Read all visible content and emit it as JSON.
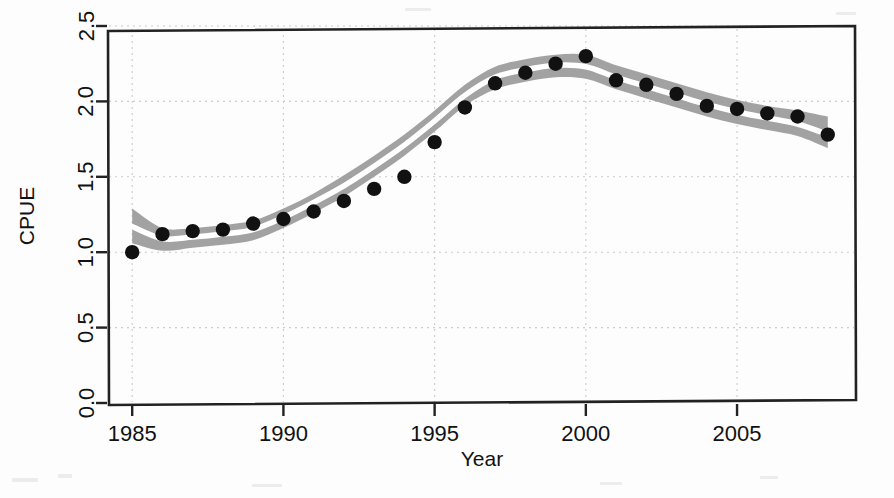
{
  "figure": {
    "background_color": "#fdfdfd",
    "frame_color": "#222222",
    "gridline_color": "#cccccc",
    "band_color": "#9a9a9a",
    "fit_line_color": "#ffffff",
    "point_color": "#111111"
  },
  "chart_data": {
    "type": "scatter",
    "title": "",
    "xlabel": "Year",
    "ylabel": "CPUE",
    "xlim": [
      1984.2,
      2008.9
    ],
    "ylim": [
      0.0,
      2.5
    ],
    "grid": true,
    "legend": "none",
    "xticks": [
      1985,
      1990,
      1995,
      2000,
      2005
    ],
    "xtick_labels": [
      "1985",
      "1990",
      "1995",
      "2000",
      "2005"
    ],
    "yticks": [
      0.0,
      0.5,
      1.0,
      1.5,
      2.0,
      2.5
    ],
    "ytick_labels": [
      "0.0",
      "0.5",
      "1.0",
      "1.5",
      "2.0",
      "2.5"
    ],
    "x": [
      1985,
      1986,
      1987,
      1988,
      1989,
      1990,
      1991,
      1992,
      1993,
      1994,
      1995,
      1996,
      1997,
      1998,
      1999,
      2000,
      2001,
      2002,
      2003,
      2004,
      2005,
      2006,
      2007,
      2008
    ],
    "series": [
      {
        "name": "Observed CPUE",
        "type": "scatter",
        "marker": "filled-circle",
        "color": "#111111",
        "values": [
          1.0,
          1.12,
          1.14,
          1.15,
          1.19,
          1.22,
          1.27,
          1.34,
          1.42,
          1.5,
          1.73,
          1.96,
          2.12,
          2.19,
          2.25,
          2.3,
          2.14,
          2.11,
          2.05,
          1.97,
          1.95,
          1.92,
          1.9,
          1.78
        ]
      },
      {
        "name": "Fitted CPUE",
        "type": "line",
        "color": "#ffffff",
        "values": [
          1.17,
          1.09,
          1.1,
          1.12,
          1.15,
          1.23,
          1.33,
          1.44,
          1.57,
          1.71,
          1.87,
          2.04,
          2.16,
          2.21,
          2.24,
          2.23,
          2.16,
          2.1,
          2.04,
          1.98,
          1.93,
          1.89,
          1.85,
          1.78
        ]
      },
      {
        "name": "Confidence band upper",
        "type": "line",
        "color": "#9a9a9a",
        "values": [
          1.29,
          1.16,
          1.16,
          1.18,
          1.21,
          1.29,
          1.39,
          1.51,
          1.64,
          1.78,
          1.94,
          2.11,
          2.23,
          2.28,
          2.31,
          2.31,
          2.24,
          2.18,
          2.12,
          2.06,
          2.01,
          1.97,
          1.94,
          1.9
        ]
      },
      {
        "name": "Confidence band lower",
        "type": "line",
        "color": "#9a9a9a",
        "values": [
          1.06,
          1.01,
          1.03,
          1.05,
          1.08,
          1.16,
          1.26,
          1.37,
          1.5,
          1.64,
          1.8,
          1.97,
          2.08,
          2.13,
          2.16,
          2.15,
          2.08,
          2.02,
          1.96,
          1.9,
          1.85,
          1.81,
          1.77,
          1.69
        ]
      }
    ]
  },
  "axes": {
    "x_axis_title": "Year",
    "y_axis_title": "CPUE"
  }
}
